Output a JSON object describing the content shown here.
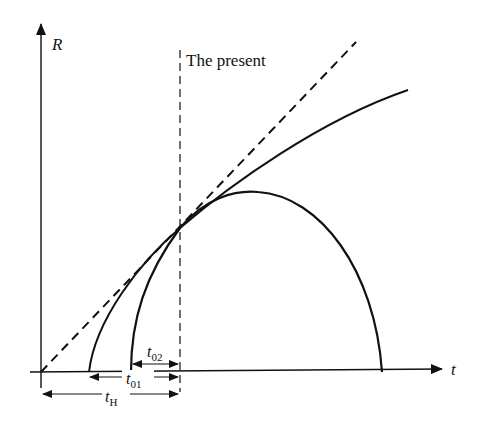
{
  "diagram": {
    "axes": {
      "y_label": "R",
      "x_label": "t"
    },
    "annotations": {
      "present_label": "The present",
      "t02": {
        "base": "t",
        "sub": "02"
      },
      "t01": {
        "base": "t",
        "sub": "01"
      },
      "tH": {
        "base": "t",
        "sub": "H"
      }
    },
    "curves": [
      {
        "name": "empty-universe-line",
        "style": "dashed",
        "description": "Straight line from origin, slope fixed by present Hubble constant"
      },
      {
        "name": "open-universe-curve",
        "style": "solid",
        "description": "Ever-expanding curve tangent to dashed line at the present"
      },
      {
        "name": "closed-universe-curve",
        "style": "solid",
        "description": "Curve that rises, peaks, and recollapses to R=0"
      }
    ],
    "colors": {
      "ink": "#111111",
      "background": "#ffffff"
    }
  }
}
